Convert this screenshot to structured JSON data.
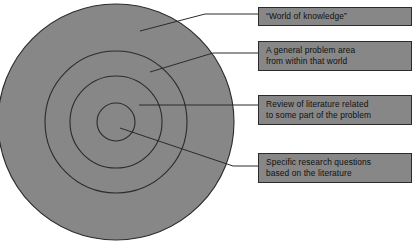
{
  "diagram": {
    "colors": {
      "circle_fill": "#878787",
      "circle_stroke": "#2b2b2b",
      "box_fill": "#878787",
      "box_stroke": "#2b2b2b",
      "leader_line": "#2b2b2b",
      "text": "#101010",
      "background": "#ffffff"
    },
    "circles": [
      {
        "name": "world-of-knowledge-ring",
        "cx": 116,
        "cy": 122,
        "r": 118
      },
      {
        "name": "general-problem-area-ring",
        "cx": 116,
        "cy": 122,
        "r": 71
      },
      {
        "name": "literature-review-ring",
        "cx": 116,
        "cy": 122,
        "r": 46
      },
      {
        "name": "research-questions-core",
        "cx": 116,
        "cy": 122,
        "r": 19
      }
    ],
    "callouts": [
      {
        "id": "world",
        "label": "world-of-knowledge",
        "lines": [
          "“World of knowledge”"
        ],
        "leader": {
          "x1": 140,
          "y1": 31,
          "x2": 205,
          "y2": 14,
          "x3": 258,
          "y3": 14
        }
      },
      {
        "id": "problem",
        "label": "general-problem-area",
        "lines": [
          "A general problem area",
          "from within that world"
        ],
        "leader": {
          "x1": 150,
          "y1": 72,
          "x2": 213,
          "y2": 53,
          "x3": 258,
          "y3": 53
        }
      },
      {
        "id": "review",
        "label": "literature-review",
        "lines": [
          "Review of literature related",
          "to some part of the problem"
        ],
        "leader": {
          "x1": 139,
          "y1": 105,
          "x2": 258,
          "y2": 105,
          "x3": 258,
          "y3": 105
        }
      },
      {
        "id": "specific",
        "label": "specific-research-questions",
        "lines": [
          "Specific research questions",
          "based on the literature"
        ],
        "leader": {
          "x1": 120,
          "y1": 128,
          "x2": 233,
          "y2": 166,
          "x3": 258,
          "y3": 166
        }
      }
    ]
  }
}
